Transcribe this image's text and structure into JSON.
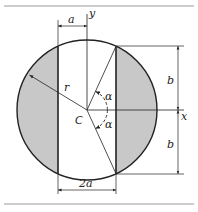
{
  "figure": {
    "type": "geometry-diagram",
    "colors": {
      "stroke": "#222222",
      "shade": "#c8c8c8",
      "rule": "#999999"
    }
  },
  "labels": {
    "a_top": "a",
    "y_axis": "y",
    "x_axis": "x",
    "radius": "r",
    "center": "C",
    "alpha_upper": "α",
    "alpha_lower": "α",
    "b_upper": "b",
    "b_lower": "b",
    "width_bottom": "2a"
  }
}
